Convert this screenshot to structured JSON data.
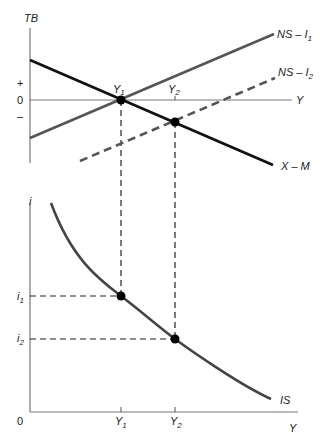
{
  "top_panel": {
    "y_axis_label": "TB",
    "x_axis_label": "Y",
    "plus_label": "+",
    "zero_label": "0",
    "minus_label": "–",
    "curves": {
      "ns_i1": {
        "label": "NS – I",
        "sub": "1"
      },
      "ns_i2": {
        "label": "NS – I",
        "sub": "2"
      },
      "x_m": {
        "label": "X – M"
      }
    },
    "points": {
      "y1": {
        "label": "Y",
        "sub": "1"
      },
      "y2": {
        "label": "Y",
        "sub": "2"
      }
    }
  },
  "bottom_panel": {
    "y_axis_label": "i",
    "x_axis_label": "Y",
    "origin_label": "0",
    "curve_label": "IS",
    "i1": {
      "label": "i",
      "sub": "1"
    },
    "i2": {
      "label": "i",
      "sub": "2"
    },
    "y1": {
      "label": "Y",
      "sub": "1"
    },
    "y2": {
      "label": "Y",
      "sub": "2"
    }
  },
  "colors": {
    "axis": "#777777",
    "x_m_line": "#111111",
    "ns_line": "#555555",
    "is_curve": "#444444",
    "dashed": "#222222",
    "point": "#000000"
  }
}
